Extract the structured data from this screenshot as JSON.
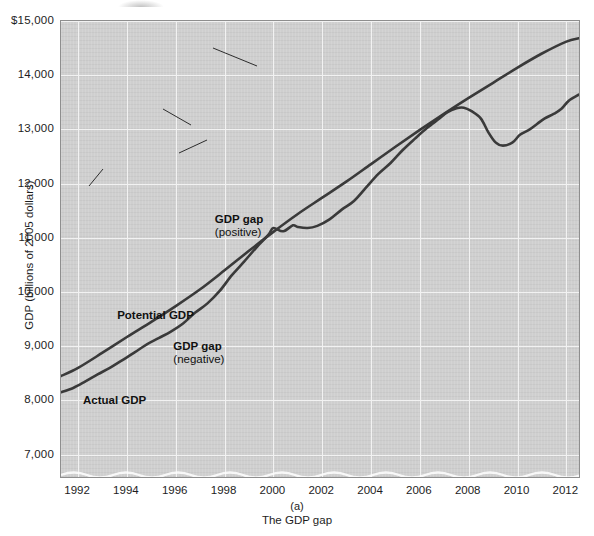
{
  "figure": {
    "panel_letter": "(a)",
    "panel_title": "The GDP gap"
  },
  "chart_data": {
    "type": "line",
    "title": "",
    "subtitle": "",
    "xlabel": "",
    "ylabel": "GDP (billions of 2005 dollars)",
    "xlim": [
      1991.3,
      2012.6
    ],
    "ylim": [
      6550,
      15000
    ],
    "xticks": [
      1992,
      1994,
      1996,
      1998,
      2000,
      2002,
      2004,
      2006,
      2008,
      2010,
      2012
    ],
    "xtick_labels": [
      "1992",
      "1994",
      "1996",
      "1998",
      "2000",
      "2002",
      "2004",
      "2006",
      "2008",
      "2010",
      "2012"
    ],
    "yticks": [
      7000,
      8000,
      9000,
      10000,
      11000,
      12000,
      13000,
      14000,
      15000
    ],
    "ytick_labels": [
      "7,000",
      "8,000",
      "9,000",
      "10,000",
      "11,000",
      "12,000",
      "13,000",
      "14,000",
      "$15,000"
    ],
    "grid": true,
    "legend": "none",
    "annotations": [
      {
        "label_bold": "GDP gap",
        "label_plain": "(positive)",
        "x": 1997.6,
        "y": 11330
      },
      {
        "label_bold": "Potential GDP",
        "label_plain": "",
        "x": 1993.6,
        "y": 9560
      },
      {
        "label_bold": "GDP gap",
        "label_plain": "(negative)",
        "x": 1995.9,
        "y": 8990
      },
      {
        "label_bold": "Actual GDP",
        "label_plain": "",
        "x": 1992.2,
        "y": 7990
      }
    ],
    "series": [
      {
        "name": "Potential GDP",
        "color": "#3a3a3a",
        "x": [
          1991.3,
          1992,
          1993,
          1994,
          1995,
          1996,
          1997,
          1998,
          1999,
          2000,
          2001,
          2002,
          2003,
          2004,
          2005,
          2006,
          2007,
          2008,
          2009,
          2010,
          2011,
          2012,
          2012.5
        ],
        "values": [
          8450,
          8600,
          8880,
          9170,
          9450,
          9740,
          10050,
          10400,
          10760,
          11110,
          11440,
          11740,
          12040,
          12360,
          12680,
          12990,
          13290,
          13580,
          13860,
          14140,
          14400,
          14620,
          14680
        ]
      },
      {
        "name": "Actual GDP",
        "color": "#3a3a3a",
        "x": [
          1991.3,
          1991.8,
          1992.3,
          1992.8,
          1993.3,
          1993.8,
          1994.3,
          1994.8,
          1995.3,
          1995.8,
          1996.3,
          1996.8,
          1997.3,
          1997.8,
          1998.3,
          1998.8,
          1999.3,
          1999.8,
          2000.0,
          2000.4,
          2000.8,
          2001.0,
          2001.4,
          2001.8,
          2002.3,
          2002.8,
          2003.3,
          2003.8,
          2004.3,
          2004.8,
          2005.3,
          2005.8,
          2006.3,
          2006.8,
          2007.1,
          2007.5,
          2007.8,
          2008.1,
          2008.5,
          2008.8,
          2009.1,
          2009.4,
          2009.8,
          2010.1,
          2010.5,
          2010.8,
          2011.1,
          2011.5,
          2011.8,
          2012.1,
          2012.5
        ],
        "values": [
          8150,
          8230,
          8350,
          8480,
          8600,
          8740,
          8880,
          9030,
          9150,
          9270,
          9420,
          9620,
          9790,
          10020,
          10310,
          10560,
          10820,
          11060,
          11180,
          11120,
          11230,
          11200,
          11180,
          11220,
          11340,
          11520,
          11680,
          11930,
          12180,
          12380,
          12620,
          12830,
          13030,
          13200,
          13310,
          13390,
          13400,
          13340,
          13200,
          12950,
          12760,
          12700,
          12760,
          12900,
          13000,
          13100,
          13200,
          13290,
          13380,
          13530,
          13640
        ]
      }
    ],
    "notes": {
      "positive_gap_period": "1998-2001 actual above potential",
      "negative_gap_period": "1992-1997 and 2002-2012 actual below potential",
      "recession_trough": {
        "x": 2009.4,
        "y": 12700
      }
    }
  }
}
